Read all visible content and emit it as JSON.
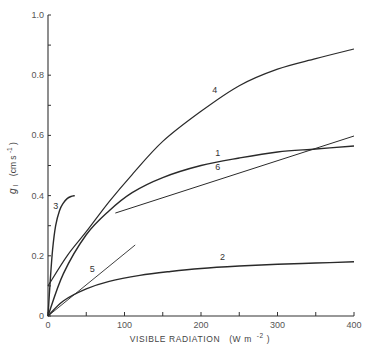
{
  "chart_data": {
    "type": "line",
    "title": "",
    "xlabel": "VISIBLE RADIATION  (W m-2)",
    "xlabel_main": "VISIBLE RADIATION",
    "xlabel_unit": "(W m",
    "xlabel_sup": "-2",
    "xlabel_close": ")",
    "ylabel": "gl (cm s-1)",
    "ylabel_sym": "g",
    "ylabel_sub": "l",
    "ylabel_unit": "(cm s",
    "ylabel_sup": "-1",
    "ylabel_close": ")",
    "xlim": [
      0,
      400
    ],
    "ylim": [
      0,
      1.0
    ],
    "grid": false,
    "legend": "none (curves labelled inline 1-6)",
    "x_ticks": [
      0,
      50,
      100,
      150,
      200,
      250,
      300,
      350,
      400
    ],
    "x_tick_labels": [
      "0",
      "",
      "100",
      "",
      "200",
      "",
      "300",
      "",
      "400"
    ],
    "y_ticks": [
      0,
      0.1,
      0.2,
      0.3,
      0.4,
      0.5,
      0.6,
      0.7,
      0.8,
      0.9,
      1.0
    ],
    "y_tick_labels": [
      "0",
      "",
      "0.2",
      "",
      "0.4",
      "",
      "0.6",
      "",
      "0.8",
      "",
      "1.0"
    ],
    "series": [
      {
        "name": "1",
        "weight": 1.4,
        "x": [
          0,
          20,
          50,
          80,
          110,
          150,
          200,
          250,
          300,
          350,
          400
        ],
        "y": [
          0.0,
          0.14,
          0.27,
          0.35,
          0.41,
          0.46,
          0.5,
          0.525,
          0.545,
          0.555,
          0.565
        ],
        "label_pos": [
          222,
          0.53
        ]
      },
      {
        "name": "2",
        "weight": 1.4,
        "x": [
          0,
          20,
          50,
          80,
          120,
          160,
          200,
          250,
          300,
          350,
          400
        ],
        "y": [
          0.0,
          0.05,
          0.09,
          0.115,
          0.135,
          0.148,
          0.158,
          0.166,
          0.172,
          0.176,
          0.18
        ],
        "label_pos": [
          228,
          0.185
        ]
      },
      {
        "name": "3",
        "weight": 1.4,
        "x": [
          0,
          3,
          6,
          10,
          15,
          20,
          25,
          30,
          35
        ],
        "y": [
          0.0,
          0.12,
          0.22,
          0.3,
          0.35,
          0.375,
          0.39,
          0.397,
          0.4
        ],
        "label_pos": [
          10,
          0.355
        ]
      },
      {
        "name": "4",
        "weight": 1.2,
        "x": [
          0,
          25,
          50,
          80,
          110,
          150,
          200,
          250,
          300,
          350,
          400
        ],
        "y": [
          0.1,
          0.2,
          0.28,
          0.38,
          0.47,
          0.58,
          0.68,
          0.765,
          0.82,
          0.855,
          0.887
        ],
        "label_pos": [
          218,
          0.74
        ]
      },
      {
        "name": "5",
        "weight": 0.9,
        "x": [
          0,
          114
        ],
        "y": [
          0.0,
          0.236
        ],
        "label_pos": [
          58,
          0.145
        ]
      },
      {
        "name": "6",
        "weight": 1.0,
        "x": [
          88,
          400
        ],
        "y": [
          0.342,
          0.598
        ],
        "label_pos": [
          222,
          0.485
        ]
      }
    ]
  }
}
